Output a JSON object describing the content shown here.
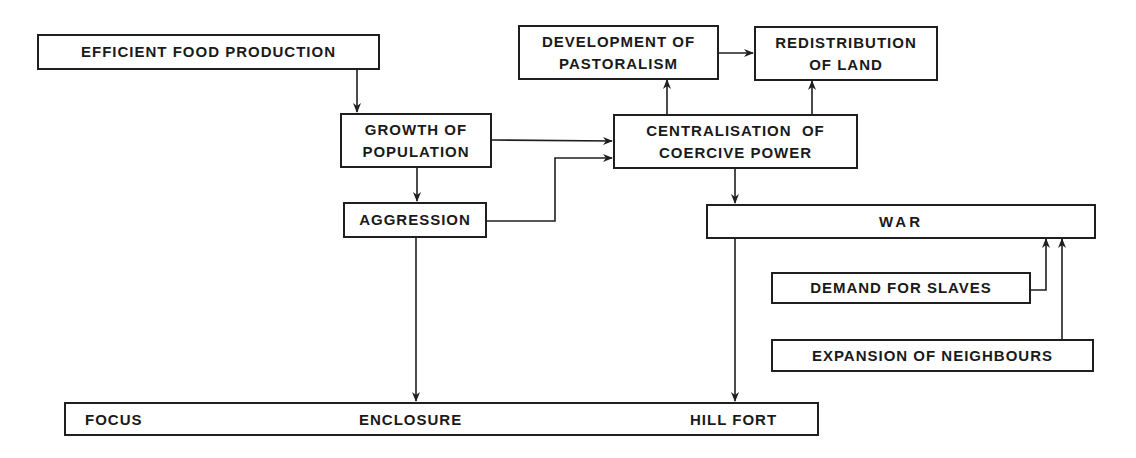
{
  "diagram": {
    "nodes": {
      "efficient_food": {
        "label": "EFFICIENT FOOD PRODUCTION"
      },
      "growth_population": {
        "line1": "GROWTH OF",
        "line2": "POPULATION"
      },
      "aggression": {
        "label": "AGGRESSION"
      },
      "pastoralism": {
        "line1": "DEVELOPMENT OF",
        "line2": "PASTORALISM"
      },
      "redistribution": {
        "line1": "REDISTRIBUTION",
        "line2": "OF LAND"
      },
      "centralisation": {
        "line1": "CENTRALISATION  OF",
        "line2": "COERCIVE POWER"
      },
      "war": {
        "label": "WAR"
      },
      "demand_slaves": {
        "label": "DEMAND FOR SLAVES"
      },
      "expansion_neighbours": {
        "label": "EXPANSION OF NEIGHBOURS"
      }
    },
    "bottom_bar": {
      "left": "FOCUS",
      "middle": "ENCLOSURE",
      "right": "HILL FORT"
    },
    "edges": [
      {
        "from": "EFFICIENT FOOD PRODUCTION",
        "to": "GROWTH OF POPULATION"
      },
      {
        "from": "GROWTH OF POPULATION",
        "to": "AGGRESSION"
      },
      {
        "from": "GROWTH OF POPULATION",
        "to": "CENTRALISATION OF COERCIVE POWER"
      },
      {
        "from": "AGGRESSION",
        "to": "CENTRALISATION OF COERCIVE POWER"
      },
      {
        "from": "CENTRALISATION OF COERCIVE POWER",
        "to": "DEVELOPMENT OF PASTORALISM"
      },
      {
        "from": "CENTRALISATION OF COERCIVE POWER",
        "to": "REDISTRIBUTION OF LAND"
      },
      {
        "from": "DEVELOPMENT OF PASTORALISM",
        "to": "REDISTRIBUTION OF LAND"
      },
      {
        "from": "CENTRALISATION OF COERCIVE POWER",
        "to": "WAR"
      },
      {
        "from": "DEMAND FOR SLAVES",
        "to": "WAR"
      },
      {
        "from": "EXPANSION OF NEIGHBOURS",
        "to": "WAR"
      },
      {
        "from": "AGGRESSION",
        "to": "ENCLOSURE"
      },
      {
        "from": "WAR",
        "to": "HILL FORT"
      }
    ]
  }
}
